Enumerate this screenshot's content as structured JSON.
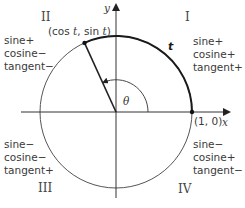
{
  "diagram": {
    "axes": {
      "x_label": "x",
      "y_label": "y"
    },
    "point_on_circle": "(cos t, sin t)",
    "point_label_parts": {
      "open": "(cos ",
      "t1": "t",
      "mid": ", sin ",
      "t2": "t",
      "close": ")"
    },
    "start_point": "(1, 0)",
    "arc_label": "t",
    "angle_label": "θ",
    "quadrants": [
      {
        "numeral": "I",
        "lines": [
          "sine+",
          "cosine+",
          "tangent+"
        ]
      },
      {
        "numeral": "II",
        "lines": [
          "sine+",
          "cosine−",
          "tangent−"
        ]
      },
      {
        "numeral": "III",
        "lines": [
          "sine−",
          "cosine−",
          "tangent+"
        ]
      },
      {
        "numeral": "IV",
        "lines": [
          "sine−",
          "cosine+",
          "tangent−"
        ]
      }
    ]
  },
  "colors": {
    "axis": "#333333",
    "circle": "#555555",
    "arc": "#1a1a1a"
  }
}
